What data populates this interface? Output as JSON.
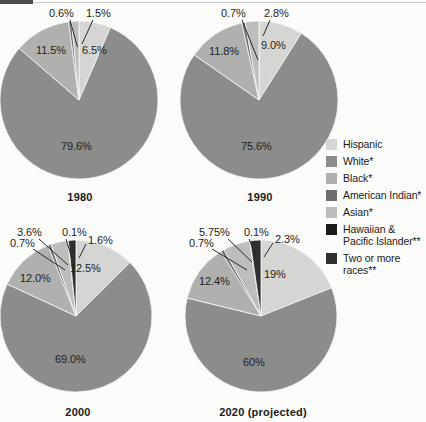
{
  "chart_data": [
    {
      "type": "pie",
      "title": "1980",
      "categories": [
        "Hispanic",
        "White*",
        "Black*",
        "American Indian*",
        "Asian*",
        "Hawaiian & Pacific Islander**",
        "Two or more races**"
      ],
      "values": [
        6.5,
        79.6,
        11.5,
        0.6,
        1.5,
        0,
        0
      ],
      "labels": [
        "6.5%",
        "79.6%",
        "11.5%",
        "0.6%",
        "1.5%",
        "",
        ""
      ],
      "legend_position": "right"
    },
    {
      "type": "pie",
      "title": "1990",
      "categories": [
        "Hispanic",
        "White*",
        "Black*",
        "American Indian*",
        "Asian*",
        "Hawaiian & Pacific Islander**",
        "Two or more races**"
      ],
      "values": [
        9.0,
        75.6,
        11.8,
        0.7,
        2.8,
        0,
        0
      ],
      "labels": [
        "9.0%",
        "75.6%",
        "11.8%",
        "0.7%",
        "2.8%",
        "",
        ""
      ],
      "legend_position": "right"
    },
    {
      "type": "pie",
      "title": "2000",
      "categories": [
        "Hispanic",
        "White*",
        "Black*",
        "American Indian*",
        "Asian*",
        "Hawaiian & Pacific Islander**",
        "Two or more races**"
      ],
      "values": [
        12.5,
        69.0,
        12.0,
        0.7,
        3.6,
        0.1,
        1.6
      ],
      "labels": [
        "12.5%",
        "69.0%",
        "12.0%",
        "0.7%",
        "3.6%",
        "0.1%",
        "1.6%"
      ],
      "legend_position": "right"
    },
    {
      "type": "pie",
      "title": "2020 (projected)",
      "categories": [
        "Hispanic",
        "White*",
        "Black*",
        "American Indian*",
        "Asian*",
        "Hawaiian & Pacific Islander**",
        "Two or more races**"
      ],
      "values": [
        19.0,
        60.0,
        12.4,
        0.7,
        5.75,
        0.1,
        2.3
      ],
      "labels": [
        "19%",
        "60%",
        "12.4%",
        "0.7%",
        "5.75%",
        "0.1%",
        "2.3%"
      ],
      "legend_position": "right"
    }
  ],
  "charts": {
    "chart1980": {
      "year": "1980",
      "hispanic": "6.5%",
      "white": "79.6%",
      "black": "11.5%",
      "american_indian": "0.6%",
      "asian": "1.5%"
    },
    "chart1990": {
      "year": "1990",
      "hispanic": "9.0%",
      "white": "75.6%",
      "black": "11.8%",
      "american_indian": "0.7%",
      "asian": "2.8%"
    },
    "chart2000": {
      "year": "2000",
      "hispanic": "12.5%",
      "white": "69.0%",
      "black": "12.0%",
      "american_indian": "0.7%",
      "asian": "3.6%",
      "hawaiian": "0.1%",
      "two_or_more": "1.6%"
    },
    "chart2020": {
      "year": "2020 (projected)",
      "hispanic": "19%",
      "white": "60%",
      "black": "12.4%",
      "american_indian": "0.7%",
      "asian": "5.75%",
      "hawaiian": "0.1%",
      "two_or_more": "2.3%"
    }
  },
  "legend": {
    "items": [
      {
        "label": "Hispanic",
        "color": "#d5d5d3"
      },
      {
        "label": "White*",
        "color": "#8c8c8a"
      },
      {
        "label": "Black*",
        "color": "#b0b0ae"
      },
      {
        "label": "American Indian*",
        "color": "#6e6e6c"
      },
      {
        "label": "Asian*",
        "color": "#bdbdbb"
      },
      {
        "label": "Hawaiian &\nPacific Islander**",
        "color": "#1c1c1c"
      },
      {
        "label": "Two or more\nraces**",
        "color": "#2f2f2f"
      }
    ]
  },
  "colors": {
    "hispanic": "#d5d5d3",
    "white": "#8c8c8a",
    "black": "#b0b0ae",
    "american_indian": "#6e6e6c",
    "asian": "#bdbdbb",
    "hawaiian": "#1c1c1c",
    "two_or_more": "#2f2f2f",
    "background": "#fbfbfa",
    "text": "#1b1b1b"
  }
}
